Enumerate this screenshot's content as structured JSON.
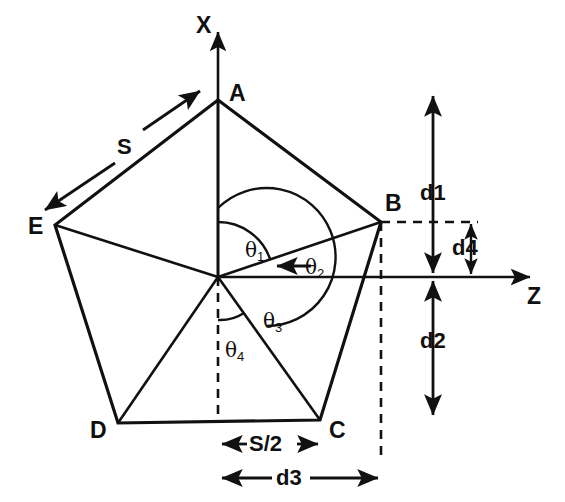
{
  "figure": {
    "stroke_color": "#111111",
    "background_color": "#ffffff"
  },
  "axes": {
    "vertical": {
      "label": "X",
      "direction": "up"
    },
    "horizontal": {
      "label": "Z",
      "direction": "right"
    },
    "origin_label": ""
  },
  "vertices": [
    {
      "id": "A",
      "label": "A"
    },
    {
      "id": "B",
      "label": "B"
    },
    {
      "id": "C",
      "label": "C"
    },
    {
      "id": "D",
      "label": "D"
    },
    {
      "id": "E",
      "label": "E"
    }
  ],
  "angles": [
    {
      "id": "theta1",
      "base": "θ",
      "sub": "1"
    },
    {
      "id": "theta2",
      "base": "θ",
      "sub": "2"
    },
    {
      "id": "theta3",
      "base": "θ",
      "sub": "3"
    },
    {
      "id": "theta4",
      "base": "θ",
      "sub": "4"
    }
  ],
  "dimensions": [
    {
      "id": "S",
      "label": "S",
      "orientation": "diagonal",
      "note": "side length, parallel to edge A-E"
    },
    {
      "id": "S2",
      "label": "S/2",
      "orientation": "horizontal",
      "note": "half side, from X-axis to vertex C"
    },
    {
      "id": "d1",
      "label": "d1",
      "orientation": "vertical",
      "note": "from top to Z axis"
    },
    {
      "id": "d2",
      "label": "d2",
      "orientation": "vertical",
      "note": "from Z axis downward"
    },
    {
      "id": "d3",
      "label": "d3",
      "orientation": "horizontal",
      "note": "from X axis to vertex B projection"
    },
    {
      "id": "d4",
      "label": "d4",
      "orientation": "vertical",
      "note": "from B level down to Z axis"
    }
  ]
}
